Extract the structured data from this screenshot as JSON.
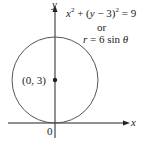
{
  "diagram": {
    "axes": {
      "x_label": "x",
      "y_label": "y",
      "origin_label": "0"
    },
    "equation_cartesian": {
      "lhs_a": "x",
      "exp1": "2",
      "mid": " + (",
      "var_y": "y",
      "minus": " − 3)",
      "exp2": "2",
      "rhs": " = 9"
    },
    "connector": "or",
    "equation_polar": {
      "r": "r",
      "eq": " = 6 sin ",
      "theta": "θ"
    },
    "center_label": "(0, 3)",
    "colors": {
      "curve": "#555555",
      "axis": "#222222"
    }
  }
}
